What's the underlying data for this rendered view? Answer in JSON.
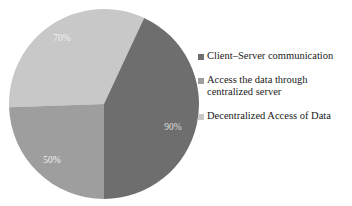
{
  "chart_data": {
    "type": "pie",
    "title": "",
    "labels": [
      "Client–Server communication",
      "Access the data through\ncentralized server",
      "Decentralized Access of Data"
    ],
    "data_labels": [
      "70%",
      "50%",
      "90%"
    ],
    "values": [
      70,
      50,
      90
    ],
    "colors": [
      "#6e6e6e",
      "#9e9e9e",
      "#c8c8c8"
    ],
    "legend_position": "right",
    "grid": false,
    "slices": [
      {
        "label": "Client–Server communication",
        "data_label": "70%",
        "value": 70,
        "color": "#6e6e6e",
        "start_angle_deg": 25,
        "end_angle_deg": 180
      },
      {
        "label": "Access the data through centralized server",
        "data_label": "50%",
        "value": 50,
        "color": "#9e9e9e",
        "start_angle_deg": 180,
        "end_angle_deg": 268
      },
      {
        "label": "Decentralized Access of Data",
        "data_label": "90%",
        "value": 90,
        "color": "#c8c8c8",
        "start_angle_deg": 268,
        "end_angle_deg": 385
      }
    ]
  },
  "legend": {
    "items": [
      {
        "label": "Client–Server communication",
        "color": "#6e6e6e"
      },
      {
        "label": "Access the data through\ncentralized server",
        "color": "#9e9e9e"
      },
      {
        "label": "Decentralized Access of Data",
        "color": "#c8c8c8"
      }
    ]
  },
  "pie_labels": {
    "dark": "70%",
    "medium": "50%",
    "light": "90%"
  }
}
